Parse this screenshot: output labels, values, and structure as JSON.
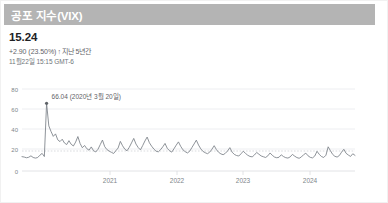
{
  "header": {
    "title": "공포 지수(VIX)"
  },
  "quote": {
    "value": "15.24",
    "change": "+2.90 (23.50%)",
    "arrow_icon": "up-arrow-icon",
    "arrow_glyph": "↑",
    "period": "지난 5년간",
    "timestamp": "11월22일 15:15 GMT-6"
  },
  "annotation": {
    "peak_label": "66.04 (2020년 3월 20일)"
  },
  "colors": {
    "header_bar": "#b4b4b4",
    "line": "#7a7f87",
    "grid": "#e8eaed",
    "text_primary": "#202124",
    "text_secondary": "#5f6368"
  },
  "chart_data": {
    "type": "line",
    "title": "공포 지수(VIX)",
    "xlabel": "",
    "ylabel": "",
    "ylim": [
      0,
      80
    ],
    "yticks": [
      0,
      20,
      40,
      60,
      80
    ],
    "xticks": [
      "2021",
      "2022",
      "2023",
      "2024"
    ],
    "grid": true,
    "legend": "none",
    "annotations": [
      {
        "label": "66.04 (2020년 3월 20일)",
        "x_index": 11,
        "value": 66.04
      }
    ],
    "series": [
      {
        "name": "VIX",
        "values": [
          14.0,
          13.6,
          12.9,
          13.4,
          14.8,
          13.2,
          12.6,
          13.1,
          15.4,
          17.2,
          14.1,
          66.04,
          44.0,
          38.5,
          33.8,
          36.2,
          30.4,
          28.7,
          31.0,
          27.3,
          25.8,
          29.6,
          26.1,
          24.4,
          28.2,
          33.6,
          26.8,
          22.7,
          24.9,
          21.8,
          20.3,
          23.5,
          19.8,
          18.6,
          21.2,
          25.7,
          30.2,
          23.8,
          20.9,
          19.4,
          18.2,
          17.1,
          19.8,
          22.4,
          28.9,
          24.6,
          21.3,
          19.7,
          23.1,
          27.4,
          31.8,
          26.3,
          22.9,
          20.6,
          24.8,
          29.3,
          33.1,
          27.6,
          24.2,
          21.4,
          19.3,
          18.7,
          20.8,
          23.6,
          26.9,
          22.1,
          19.8,
          18.4,
          21.7,
          25.2,
          28.4,
          24.1,
          20.7,
          18.9,
          17.6,
          19.2,
          22.8,
          26.4,
          30.1,
          25.3,
          21.6,
          19.1,
          17.8,
          16.9,
          18.4,
          21.3,
          24.7,
          20.8,
          18.2,
          16.7,
          15.9,
          17.3,
          19.6,
          22.8,
          18.4,
          16.2,
          15.1,
          14.6,
          16.8,
          19.3,
          17.2,
          15.4,
          14.2,
          13.8,
          15.6,
          18.1,
          16.4,
          14.7,
          13.9,
          13.2,
          14.8,
          17.6,
          15.3,
          13.6,
          12.9,
          13.4,
          15.8,
          14.1,
          13.0,
          12.6,
          13.8,
          16.2,
          14.5,
          13.1,
          12.4,
          13.7,
          15.9,
          17.4,
          14.8,
          13.3,
          12.8,
          14.6,
          19.2,
          16.3,
          14.1,
          13.2,
          15.4,
          23.6,
          19.8,
          16.2,
          14.3,
          13.6,
          15.1,
          18.4,
          21.2,
          17.3,
          15.6,
          14.2,
          16.8,
          15.24
        ]
      }
    ]
  }
}
